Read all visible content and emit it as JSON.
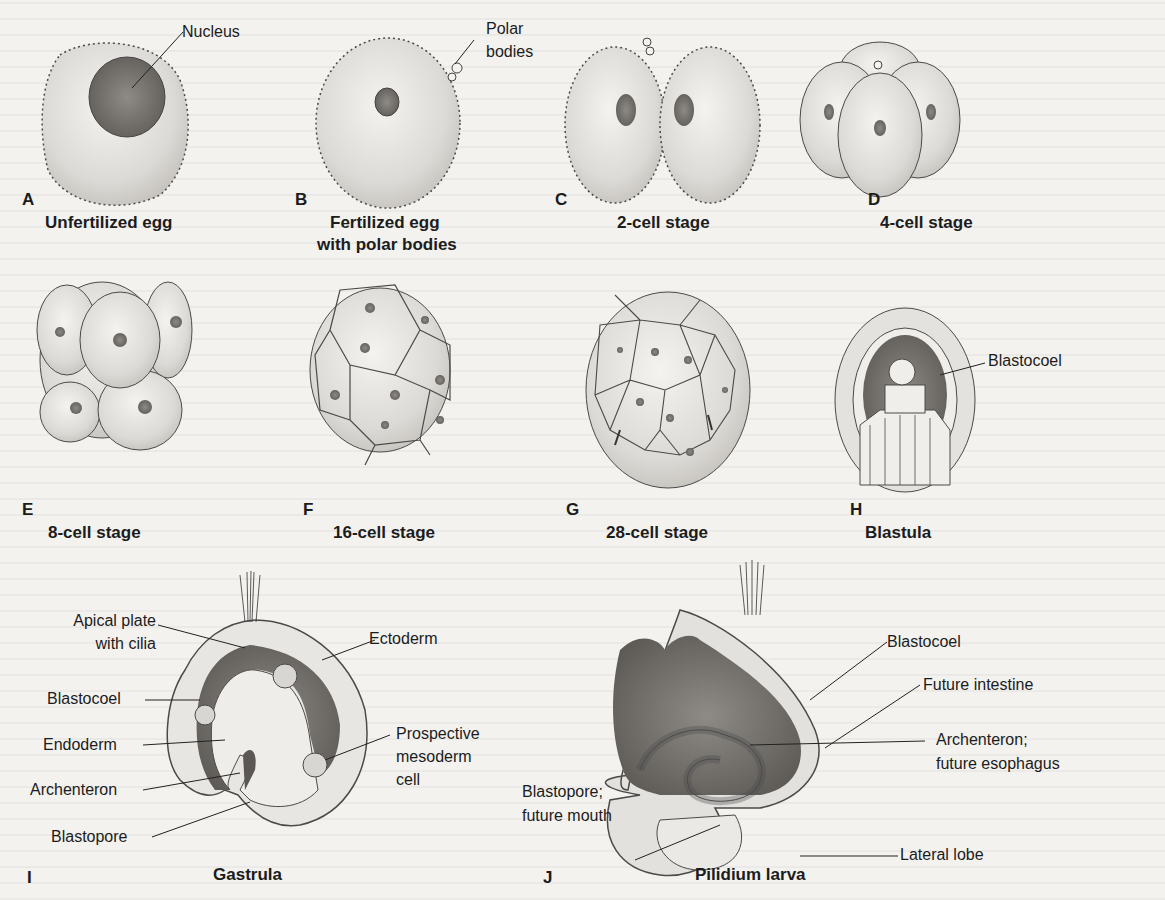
{
  "figure": {
    "panels": [
      {
        "letter": "A",
        "caption": "Unfertilized egg",
        "labels": [
          "Nucleus"
        ]
      },
      {
        "letter": "B",
        "caption_line1": "Fertilized egg",
        "caption_line2": "with polar bodies",
        "labels": [
          "Polar",
          "bodies"
        ]
      },
      {
        "letter": "C",
        "caption": "2-cell stage"
      },
      {
        "letter": "D",
        "caption": "4-cell stage"
      },
      {
        "letter": "E",
        "caption": "8-cell stage"
      },
      {
        "letter": "F",
        "caption": "16-cell stage"
      },
      {
        "letter": "G",
        "caption": "28-cell stage"
      },
      {
        "letter": "H",
        "caption": "Blastula",
        "labels": [
          "Blastocoel"
        ]
      },
      {
        "letter": "I",
        "caption": "Gastrula",
        "labels": [
          "Apical plate",
          "with cilia",
          "Blastocoel",
          "Endoderm",
          "Archenteron",
          "Blastopore",
          "Ectoderm",
          "Prospective",
          "mesoderm",
          "cell"
        ]
      },
      {
        "letter": "J",
        "caption": "Pilidium larva",
        "labels": [
          "Blastocoel",
          "Future intestine",
          "Archenteron;",
          "future esophagus",
          "Blastopore;",
          "future mouth",
          "Lateral lobe"
        ]
      }
    ]
  },
  "colors": {
    "background": "#f3f2ef",
    "cell_fill": "#e2e0dc",
    "cell_stroke": "#4a4a4a",
    "nucleus": "#8a8783",
    "blastocoel_dark": "#6f6c68"
  }
}
